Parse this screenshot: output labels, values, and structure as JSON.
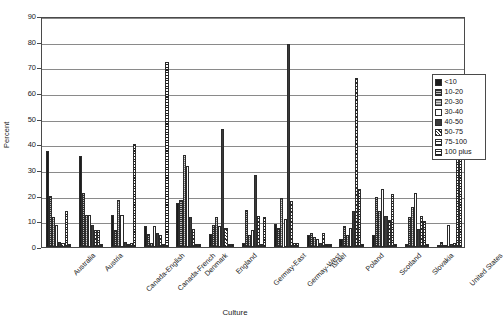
{
  "chart_data": {
    "type": "bar",
    "title": "",
    "xlabel": "Culture",
    "ylabel": "Percent",
    "ylim": [
      0,
      90
    ],
    "yticks": [
      0,
      10,
      20,
      30,
      40,
      50,
      60,
      70,
      80,
      90
    ],
    "grid": true,
    "legend_position": "right",
    "categories": [
      "Australia",
      "Austria",
      "Canada-English",
      "Canada-French",
      "Denmark",
      "England",
      "Germay-East",
      "Germay-West",
      "Israel",
      "Poland",
      "Scotland",
      "Slovakia",
      "United States"
    ],
    "series": [
      {
        "name": "<10",
        "values": [
          37.5,
          35.5,
          12.5,
          8.0,
          17.0,
          5.0,
          1.5,
          9.0,
          4.5,
          3.0,
          4.5,
          1.0,
          0.5
        ]
      },
      {
        "name": "10-20",
        "values": [
          20.0,
          21.0,
          6.5,
          5.0,
          18.5,
          8.5,
          14.5,
          7.5,
          5.5,
          8.0,
          19.5,
          11.5,
          2.0
        ]
      },
      {
        "name": "20-30",
        "values": [
          11.5,
          12.5,
          18.5,
          1.5,
          36.0,
          11.5,
          4.5,
          19.0,
          4.0,
          4.5,
          14.0,
          15.5,
          0.5
        ]
      },
      {
        "name": "30-40",
        "values": [
          8.5,
          12.5,
          12.5,
          8.0,
          31.5,
          8.0,
          6.5,
          11.0,
          3.0,
          7.5,
          22.5,
          21.0,
          8.5
        ]
      },
      {
        "name": "40-50",
        "values": [
          2.0,
          8.5,
          2.0,
          5.5,
          11.5,
          46.0,
          28.0,
          79.0,
          1.5,
          14.0,
          12.0,
          7.0,
          1.0
        ]
      },
      {
        "name": "50-75",
        "values": [
          1.5,
          6.5,
          1.0,
          4.5,
          7.0,
          7.5,
          12.0,
          18.0,
          5.5,
          66.0,
          10.5,
          12.0,
          1.5
        ]
      },
      {
        "name": "75-100",
        "values": [
          14.0,
          6.5,
          1.5,
          1.0,
          1.0,
          1.0,
          1.0,
          1.5,
          1.0,
          22.5,
          20.5,
          10.0,
          42.0
        ]
      },
      {
        "name": "100 plus",
        "values": [
          1.0,
          1.0,
          40.0,
          72.0,
          1.0,
          1.0,
          11.5,
          1.5,
          1.0,
          1.0,
          1.0,
          1.0,
          49.0
        ]
      }
    ]
  },
  "legend": {
    "items": [
      {
        "label": "<10"
      },
      {
        "label": "10-20"
      },
      {
        "label": "20-30"
      },
      {
        "label": "30-40"
      },
      {
        "label": "40-50"
      },
      {
        "label": "50-75"
      },
      {
        "label": "75-100"
      },
      {
        "label": "100 plus"
      }
    ]
  }
}
